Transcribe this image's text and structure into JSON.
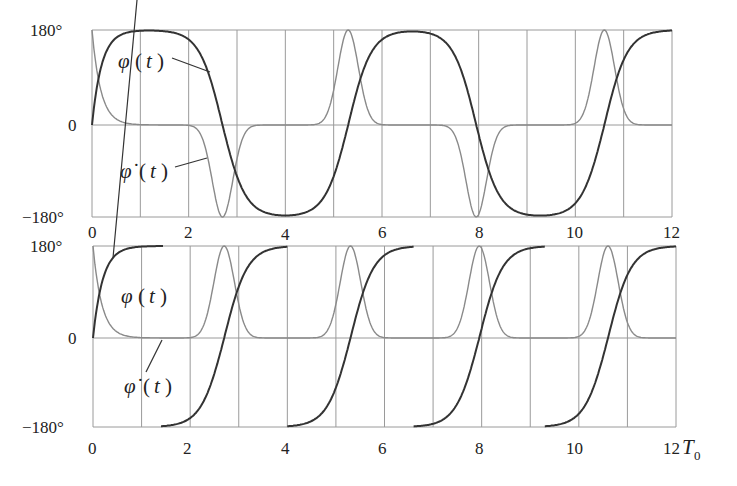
{
  "chart_data": [
    {
      "type": "line",
      "panel": "top",
      "x_ticks": [
        "0",
        "2",
        "4",
        "6",
        "8",
        "10",
        "12"
      ],
      "y_ticks": [
        "180°",
        "0",
        "−180°"
      ],
      "xlim": [
        0,
        12
      ],
      "ylim": [
        -180,
        180
      ],
      "grid": true,
      "annotations": [
        "φ(t)",
        "φ̇(t)"
      ],
      "series": [
        {
          "name": "φ(t)",
          "x": [
            0,
            0.5,
            1,
            1.5,
            2,
            2.4,
            2.7,
            3,
            3.5,
            4,
            4.5,
            5,
            5.3,
            5.6,
            6,
            6.5,
            7,
            7.5,
            7.8,
            8.1,
            8.5,
            9,
            9.5,
            10,
            10.4,
            10.6,
            10.9,
            11.3,
            12
          ],
          "y": [
            0,
            165,
            178,
            180,
            178,
            150,
            0,
            -150,
            -178,
            -180,
            -178,
            -160,
            0,
            160,
            178,
            180,
            178,
            140,
            0,
            -150,
            -178,
            -180,
            -178,
            -165,
            -60,
            0,
            150,
            178,
            180
          ]
        },
        {
          "name": "φ̇(t)",
          "x": [
            0,
            0.3,
            0.6,
            1,
            2,
            2.3,
            2.6,
            2.7,
            2.8,
            3.2,
            4,
            5,
            5.3,
            5.6,
            6,
            7,
            7.5,
            7.9,
            8.2,
            8.6,
            9,
            10,
            10.4,
            10.6,
            10.9,
            11.3,
            12
          ],
          "y": [
            180,
            60,
            10,
            0,
            0,
            -40,
            -160,
            -180,
            -150,
            -20,
            0,
            20,
            180,
            60,
            5,
            0,
            -30,
            -180,
            -60,
            -5,
            0,
            10,
            90,
            180,
            90,
            5,
            0
          ]
        }
      ]
    },
    {
      "type": "line",
      "panel": "bottom",
      "x_ticks": [
        "0",
        "2",
        "4",
        "6",
        "8",
        "10",
        "12"
      ],
      "x_unit": "T0",
      "y_ticks": [
        "180°",
        "0",
        "−180°"
      ],
      "xlim": [
        0,
        12
      ],
      "ylim": [
        -180,
        180
      ],
      "grid": true,
      "annotations": [
        "φ(t)",
        "φ̇(t)"
      ],
      "series": [
        {
          "name": "φ(t) (wrapped)",
          "x": [
            0,
            0.5,
            1,
            1.4,
            1.4,
            2,
            2.4,
            2.7,
            3,
            3.5,
            4,
            4,
            4.6,
            5,
            5.3,
            5.6,
            6,
            6.6,
            6.6,
            7.3,
            7.7,
            7.95,
            8.3,
            8.7,
            9.3,
            9.3,
            10,
            10.4,
            10.6,
            10.9,
            11.4,
            12
          ],
          "y": [
            0,
            165,
            178,
            180,
            -180,
            -178,
            -140,
            0,
            150,
            178,
            180,
            -180,
            -178,
            -160,
            0,
            150,
            178,
            180,
            -180,
            -178,
            -150,
            0,
            150,
            178,
            180,
            -180,
            -178,
            -150,
            0,
            150,
            178,
            180
          ]
        },
        {
          "name": "φ̇(t)",
          "x": [
            0,
            0.3,
            0.6,
            1,
            2,
            2.4,
            2.7,
            3,
            3.5,
            4,
            4.8,
            5.3,
            5.8,
            6.5,
            7.5,
            7.95,
            8.4,
            9,
            10,
            10.4,
            10.6,
            10.9,
            11.3,
            12
          ],
          "y": [
            180,
            60,
            10,
            0,
            0,
            40,
            180,
            60,
            5,
            0,
            10,
            180,
            30,
            0,
            10,
            180,
            30,
            0,
            5,
            60,
            180,
            60,
            5,
            0
          ]
        }
      ]
    }
  ],
  "top": {
    "y_labels": [
      "180°",
      "0",
      "−180°"
    ],
    "x_labels": [
      "0",
      "2",
      "4",
      "6",
      "8",
      "10",
      "12"
    ],
    "label_phi": "φ",
    "label_phidot": "φ̇",
    "label_t": "t"
  },
  "bottom": {
    "y_labels": [
      "180°",
      "0",
      "−180°"
    ],
    "x_labels": [
      "0",
      "2",
      "4",
      "6",
      "8",
      "10",
      "12"
    ],
    "x_unit": "T",
    "x_unit_sub": "0",
    "label_phi": "φ",
    "label_phidot": "φ̇",
    "label_t": "t"
  }
}
